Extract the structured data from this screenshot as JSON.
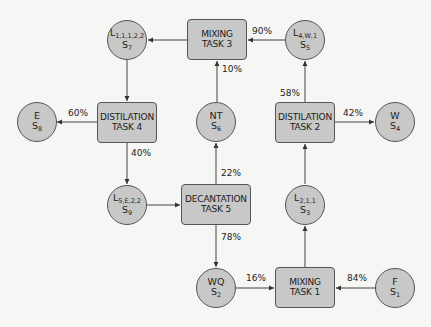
{
  "diagram": {
    "colors": {
      "node_fill": "#c8c8c8",
      "node_border": "#555555",
      "edge": "#444444",
      "background": "#f6f6f4"
    },
    "tasks": [
      {
        "id": "mix3",
        "line1": "MIXING",
        "line2": "TASK 3"
      },
      {
        "id": "dist4",
        "line1": "DISTILATION",
        "line2": "TASK 4"
      },
      {
        "id": "dist2",
        "line1": "DISTILATION",
        "line2": "TASK 2"
      },
      {
        "id": "dec5",
        "line1": "DECANTATION",
        "line2": "TASK 5"
      },
      {
        "id": "mix1",
        "line1": "MIXING",
        "line2": "TASK 1"
      }
    ],
    "states": [
      {
        "id": "s7",
        "name": "L",
        "name_sub": "1,1,1,2,2",
        "state": "S",
        "state_sub": "7"
      },
      {
        "id": "s5",
        "name": "L",
        "name_sub": "4,W,1",
        "state": "S",
        "state_sub": "5"
      },
      {
        "id": "s8",
        "name": "E",
        "name_sub": "",
        "state": "S",
        "state_sub": "8"
      },
      {
        "id": "s6",
        "name": "NT",
        "name_sub": "",
        "state": "S",
        "state_sub": "6"
      },
      {
        "id": "s4",
        "name": "W",
        "name_sub": "",
        "state": "S",
        "state_sub": "4"
      },
      {
        "id": "s9",
        "name": "L",
        "name_sub": "5,E,2,2",
        "state": "S",
        "state_sub": "9"
      },
      {
        "id": "s3",
        "name": "L",
        "name_sub": "2,1,1",
        "state": "S",
        "state_sub": "3"
      },
      {
        "id": "s2",
        "name": "WQ",
        "name_sub": "",
        "state": "S",
        "state_sub": "2"
      },
      {
        "id": "s1",
        "name": "F",
        "name_sub": "",
        "state": "S",
        "state_sub": "1"
      }
    ],
    "edge_labels": {
      "s5_to_mix3": "90%",
      "s6_to_mix3": "10%",
      "dist4_to_s8": "60%",
      "dist4_to_s9": "40%",
      "dist2_to_s5": "58%",
      "dist2_to_s4": "42%",
      "dec5_to_s6": "22%",
      "dec5_to_s2": "78%",
      "s2_to_mix1": "16%",
      "s1_to_mix1": "84%"
    }
  }
}
